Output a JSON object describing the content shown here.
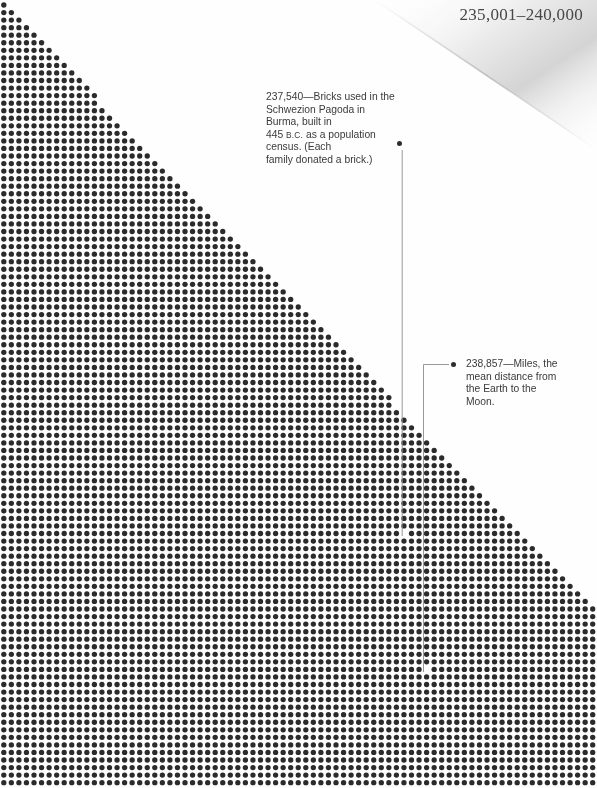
{
  "page": {
    "width": 597,
    "height": 788,
    "background": "#ffffff",
    "header_number": "235,001–240,000",
    "range_start": 235001,
    "range_end": 240000
  },
  "colors": {
    "dot": "#2b2b2b",
    "text": "#3a3a3a",
    "header_text": "#474747",
    "leader_line": "#8d8d8d",
    "bullet": "#2c2c2c",
    "page_curl_shadow": "#d8d8d8"
  },
  "dot_grid": {
    "pitch_x": 7.55,
    "pitch_y": 7.55,
    "dot_radius": 2.65,
    "origin_x": 3.8,
    "origin_y": 5.0,
    "columns": 79,
    "rows": 104,
    "total_dots": 5000,
    "shape": "lower-left-triangle-then-full",
    "diagonal_start_xy": [
      0,
      0
    ],
    "diagonal_end_xy": [
      597,
      612
    ],
    "note": "Dots fill the area below a diagonal running from the top-left corner to the right edge at y=612; below that the field is solid."
  },
  "annotations": [
    {
      "id": "annotation-1",
      "value": "237,540",
      "lines": [
        "237,540—Bricks used in the",
        "Schwezion Pagoda in Burma, built in",
        "445 B.C. as a population census. (Each",
        "family donated a brick.)"
      ],
      "line1": "237,540—Bricks used in the",
      "line2": "Schwezion Pagoda in Burma, built in",
      "line3_pre": "445 ",
      "line3_smallcaps": "B.C.",
      "line3_post": " as a population census. (Each",
      "line4": "family donated a brick.)",
      "bullet_xy": [
        399,
        145
      ],
      "target_dot_xy": [
        406,
        536
      ],
      "leader_kind": "vertical"
    },
    {
      "id": "annotation-2",
      "value": "238,857",
      "lines": [
        "238,857—Miles, the",
        "mean distance from",
        "the Earth to the",
        "Moon."
      ],
      "line1": "238,857—Miles, the",
      "line2": "mean distance from",
      "line3": "the Earth to the",
      "line4": "Moon.",
      "bullet_xy": [
        453,
        364
      ],
      "target_dot_xy": [
        428,
        672
      ],
      "leader_kind": "elbow"
    }
  ],
  "leader_lines": [
    {
      "name": "leader-line-237540",
      "points": [
        [
          402.2,
          150
        ],
        [
          402.2,
          536
        ]
      ],
      "width": 0.9
    },
    {
      "name": "leader-line-238857",
      "points": [
        [
          449,
          364.5
        ],
        [
          423.5,
          364.5
        ],
        [
          423.5,
          672
        ]
      ],
      "width": 0.9
    }
  ]
}
